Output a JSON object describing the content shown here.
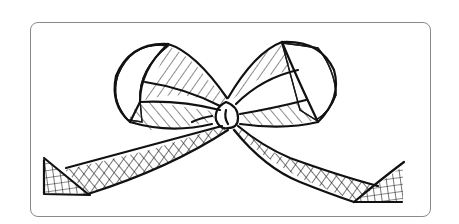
{
  "figure": {
    "alt": "Line drawing of a ribbon bow with crosshatched loops and trailing tails",
    "colors": {
      "background": "#ffffff",
      "frame_border": "#8a8a8a",
      "ink": "#111111"
    }
  }
}
